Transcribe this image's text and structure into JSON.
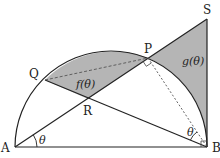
{
  "diagram": {
    "type": "geometry",
    "colors": {
      "stroke": "#222222",
      "shade": "#b5b5b5",
      "background": "#ffffff",
      "dashed": "#555555"
    },
    "points": {
      "A": {
        "label": "A",
        "x": 15,
        "y": 147
      },
      "B": {
        "label": "B",
        "x": 207,
        "y": 147
      },
      "P": {
        "label": "P",
        "x": 148,
        "y": 58
      },
      "Q": {
        "label": "Q",
        "x": 45,
        "y": 80
      },
      "R": {
        "label": "R",
        "x": 88,
        "y": 99
      },
      "S": {
        "label": "S",
        "x": 207,
        "y": 19
      }
    },
    "regions": {
      "f": {
        "label": "f(θ)"
      },
      "g": {
        "label": "g(θ)"
      }
    },
    "angles": {
      "at_A": {
        "label": "θ"
      },
      "at_B": {
        "label": "θ"
      }
    },
    "right_angle_marks": [
      "P",
      "B"
    ]
  }
}
